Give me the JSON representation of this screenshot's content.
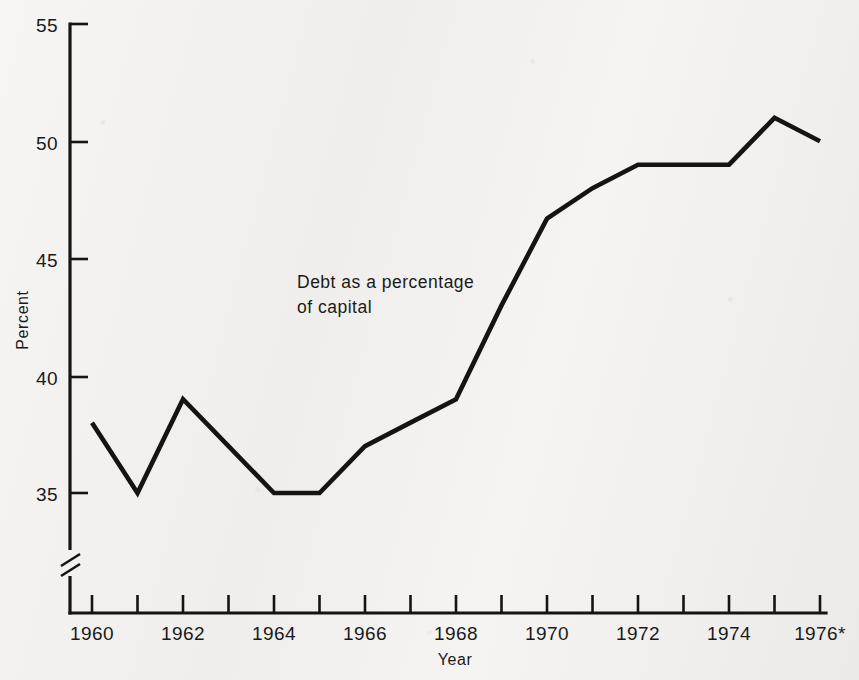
{
  "chart_data": {
    "type": "line",
    "title": "",
    "subtitle": "",
    "xlabel": "Year",
    "ylabel": "Percent",
    "x": [
      1960,
      1961,
      1962,
      1963,
      1964,
      1965,
      1966,
      1967,
      1968,
      1969,
      1970,
      1971,
      1972,
      1973,
      1974,
      1975,
      1976
    ],
    "values": [
      38,
      35,
      39,
      37,
      35,
      35,
      37,
      38,
      39,
      43,
      46.7,
      48,
      49,
      49,
      49,
      51,
      50
    ],
    "series": [
      {
        "name": "Debt as a percentage of capital",
        "values": [
          38,
          35,
          39,
          37,
          35,
          35,
          37,
          38,
          39,
          43,
          46.7,
          48,
          49,
          49,
          49,
          51,
          50
        ]
      }
    ],
    "xlim": [
      1959.5,
      1976.3
    ],
    "ylim": [
      33.2,
      55
    ],
    "ytick_values": [
      35,
      40,
      45,
      50,
      55
    ],
    "ytick_labels": [
      "35",
      "40",
      "45",
      "50",
      "55"
    ],
    "xtick_values": [
      1960,
      1961,
      1962,
      1963,
      1964,
      1965,
      1966,
      1967,
      1968,
      1969,
      1970,
      1971,
      1972,
      1973,
      1974,
      1975,
      1976
    ],
    "xtick_labels": [
      "1960",
      "",
      "1962",
      "",
      "1964",
      "",
      "1966",
      "",
      "1968",
      "",
      "1970",
      "",
      "1972",
      "",
      "1974",
      "",
      "1976*"
    ],
    "grid": false,
    "legend": "none",
    "axis_break": true,
    "axis_break_note": "broken y-axis below 35",
    "annotations": [
      {
        "line1": "Debt as a percentage",
        "line2": "of capital"
      }
    ],
    "line_color": "#141414",
    "axis_color": "#141414",
    "background_color": "#f2f1ef"
  }
}
